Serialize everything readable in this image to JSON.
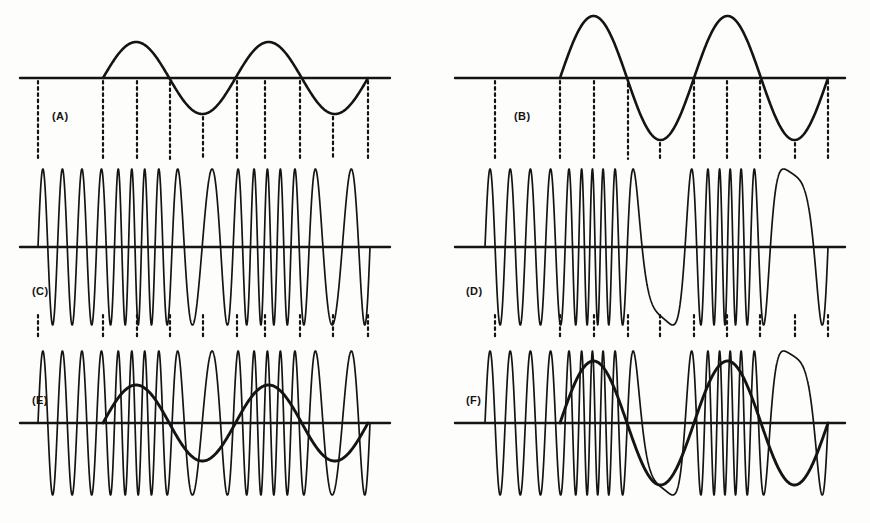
{
  "figure": {
    "background_color": "#fdfdfc",
    "ink_color": "#141414",
    "width": 870,
    "height": 523
  },
  "panels": [
    {
      "id": "A",
      "label": "(A)",
      "label_x": 52,
      "label_y": 110,
      "column": "left",
      "row": "top",
      "description": "modulating sine wave, low amplitude",
      "baseline_y": 78,
      "x_start": 20,
      "x_end": 390,
      "wave_start": 103,
      "wave_end": 368,
      "amplitude": 36,
      "cycles": 2
    },
    {
      "id": "B",
      "label": "(B)",
      "label_x": 514,
      "label_y": 110,
      "column": "right",
      "row": "top",
      "description": "modulating sine wave, high amplitude",
      "baseline_y": 78,
      "x_start": 455,
      "x_end": 845,
      "wave_start": 560,
      "wave_end": 828,
      "amplitude": 62,
      "cycles": 2
    },
    {
      "id": "C",
      "label": "(C)",
      "label_x": 32,
      "label_y": 285,
      "column": "left",
      "row": "middle",
      "description": "frequency modulated carrier, low deviation",
      "baseline_y": 247,
      "x_start": 20,
      "x_end": 390,
      "wave_start": 38,
      "wave_end": 370,
      "amplitude": 78,
      "carrier_cycles": 17,
      "deviation": 0.42
    },
    {
      "id": "D",
      "label": "(D)",
      "label_x": 466,
      "label_y": 285,
      "column": "right",
      "row": "middle",
      "description": "frequency modulated carrier, high deviation",
      "baseline_y": 247,
      "x_start": 455,
      "x_end": 845,
      "wave_start": 485,
      "wave_end": 828,
      "amplitude": 78,
      "carrier_cycles": 17,
      "deviation": 0.72
    },
    {
      "id": "E",
      "label": "(E)",
      "label_x": 32,
      "label_y": 394,
      "column": "left",
      "row": "bottom",
      "description": "modulating wave superimposed on modulated carrier, low deviation",
      "baseline_y": 423,
      "x_start": 20,
      "x_end": 390,
      "wave_start": 38,
      "wave_end": 370,
      "amplitude": 72,
      "carrier_cycles": 17,
      "deviation": 0.42,
      "overlay_amplitude": 38,
      "overlay_start": 103,
      "overlay_end": 368
    },
    {
      "id": "F",
      "label": "(F)",
      "label_x": 466,
      "label_y": 394,
      "column": "right",
      "row": "bottom",
      "description": "modulating wave superimposed on modulated carrier, high deviation",
      "baseline_y": 423,
      "x_start": 455,
      "x_end": 845,
      "wave_start": 485,
      "wave_end": 828,
      "amplitude": 72,
      "carrier_cycles": 17,
      "deviation": 0.72,
      "overlay_amplitude": 62,
      "overlay_start": 560,
      "overlay_end": 828
    }
  ],
  "chart_data": {
    "type": "line",
    "xlabel": "",
    "ylabel": "",
    "grid": false,
    "legend_position": "none",
    "annotations": [
      "(A)",
      "(B)",
      "(C)",
      "(D)",
      "(E)",
      "(F)"
    ],
    "series": [
      {
        "name": "(A) modulating sine — low amplitude",
        "waveform": "sine",
        "cycles": 2,
        "relative_amplitude": 0.58,
        "phase_deg": 0
      },
      {
        "name": "(B) modulating sine — high amplitude",
        "waveform": "sine",
        "cycles": 2,
        "relative_amplitude": 1.0,
        "phase_deg": 0
      },
      {
        "name": "(C) FM carrier — low deviation",
        "waveform": "frequency-modulated-carrier",
        "carrier_cycles": 17,
        "modulation_index": 0.42,
        "relative_amplitude": 1.0
      },
      {
        "name": "(D) FM carrier — high deviation",
        "waveform": "frequency-modulated-carrier",
        "carrier_cycles": 17,
        "modulation_index": 0.72,
        "relative_amplitude": 1.0
      },
      {
        "name": "(E) FM carrier with modulating wave overlay — low deviation",
        "waveform": "frequency-modulated-carrier+sine-overlay",
        "carrier_cycles": 17,
        "modulation_index": 0.42,
        "overlay_cycles": 2,
        "overlay_relative_amplitude": 0.58
      },
      {
        "name": "(F) FM carrier with modulating wave overlay — high deviation",
        "waveform": "frequency-modulated-carrier+sine-overlay",
        "carrier_cycles": 17,
        "modulation_index": 0.72,
        "overlay_cycles": 2,
        "overlay_relative_amplitude": 1.0
      }
    ]
  },
  "tick_marks": {
    "description": "dotted vertical guide lines linking modulating wave features to the carrier panels",
    "left_column_x": [
      38,
      103,
      137,
      170,
      203,
      237,
      265,
      300,
      333,
      368
    ],
    "right_column_x": [
      495,
      560,
      594,
      628,
      660,
      694,
      727,
      760,
      795,
      828
    ]
  }
}
